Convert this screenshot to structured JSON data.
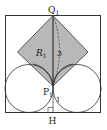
{
  "diagram": {
    "type": "geometry",
    "labels": {
      "top_point": "Q",
      "top_point_sub": "1",
      "middle_point": "P",
      "middle_point_sub": "1",
      "foot_point": "H",
      "region": "R",
      "region_sub": "1",
      "length_upper": "3",
      "length_lower": "1"
    },
    "colors": {
      "stroke": "#333333",
      "fill_region": "#b8b8b8",
      "background": "#ffffff"
    }
  }
}
